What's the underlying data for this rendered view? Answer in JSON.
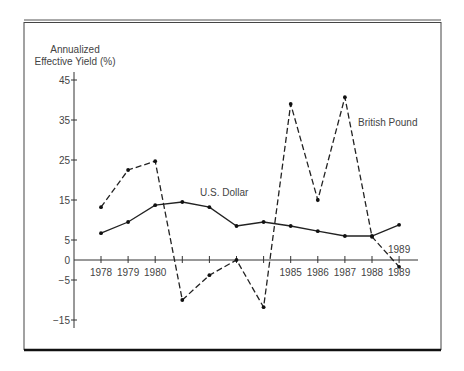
{
  "chart_data": {
    "type": "line",
    "title": "",
    "ylabel": "Annualized\nEffective Yield (%)",
    "ylabel_lines": [
      "Annualized",
      "Effective Yield (%)"
    ],
    "xlabel": "",
    "ylim": [
      -15,
      45
    ],
    "yticks": [
      45,
      35,
      25,
      15,
      5,
      0,
      -5,
      -15
    ],
    "ytick_labels": [
      "45",
      "35",
      "25",
      "15",
      "5",
      "0",
      "−5",
      "−15"
    ],
    "x": [
      1978,
      1979,
      1980,
      1981,
      1982,
      1983,
      1984,
      1985,
      1986,
      1987,
      1988,
      1989
    ],
    "xtick_labels": [
      "1978",
      "1979",
      "1980",
      "",
      "",
      "",
      "",
      "1985",
      "1986",
      "1987",
      "1988",
      "1989"
    ],
    "grid": false,
    "legend": "inline labels",
    "series": [
      {
        "name": "U.S. Dollar",
        "style": "solid",
        "values": [
          6.7,
          9.5,
          13.7,
          14.5,
          13.2,
          8.5,
          9.5,
          8.5,
          7.2,
          6.0,
          6.0,
          8.8
        ]
      },
      {
        "name": "British Pound",
        "style": "dashed",
        "values": [
          13.2,
          22.5,
          24.7,
          -10.0,
          -3.8,
          0.0,
          -11.8,
          39.0,
          15.0,
          40.7,
          5.8,
          -1.7
        ]
      }
    ],
    "annotations": [
      {
        "text": "U.S. Dollar",
        "near": 1982
      },
      {
        "text": "British Pound",
        "near": 1988
      },
      {
        "text": "1989",
        "near": 1989
      }
    ]
  },
  "labels": {
    "ylabel_1": "Annualized",
    "ylabel_2": "Effective Yield (%)",
    "usd": "U.S. Dollar",
    "gbp": "British Pound",
    "y1989": "1989"
  },
  "colors": {
    "line": "#222222",
    "frame": "#333333",
    "text": "#444444"
  }
}
